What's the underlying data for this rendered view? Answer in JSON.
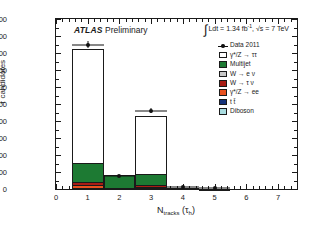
{
  "chart_data": {
    "type": "bar",
    "title": "",
    "experiment_label": "ATLAS",
    "status_label": "Preliminary",
    "lumi_text": "Ldt = 1.34 fb",
    "lumi_sup": "-1",
    "energy_text": ", √s = 7 TeV",
    "integral_symbol": "∫",
    "xlabel_main": "N",
    "xlabel_sub": "tracks",
    "xlabel_paren_open": " (τ",
    "xlabel_paren_sub": "h",
    "xlabel_paren_close": ")",
    "ylabel": "τ candidates",
    "xlim": [
      0,
      7.6
    ],
    "ylim": [
      0,
      2000
    ],
    "xticks": [
      0,
      1,
      2,
      3,
      4,
      5,
      6,
      7
    ],
    "yticks": [
      0,
      200,
      400,
      600,
      800,
      1000,
      1200,
      1400,
      1600,
      1800,
      2000
    ],
    "grid": false,
    "legend_position": "upper-right",
    "categories": [
      1,
      2,
      3,
      4,
      5,
      6,
      7
    ],
    "bin_width": 1,
    "series": [
      {
        "name": "γ*/Z → ττ",
        "color": "#ffffff",
        "values": [
          1345,
          0,
          685,
          0,
          0,
          0,
          0
        ]
      },
      {
        "name": "Multijet",
        "color": "#1d7a33",
        "values": [
          220,
          150,
          130,
          8,
          2,
          0,
          0
        ]
      },
      {
        "name": "W → e ν",
        "color": "#c8c8c8",
        "values": [
          8,
          3,
          4,
          0,
          0,
          0,
          0
        ]
      },
      {
        "name": "W → τ ν",
        "color": "#a81c14",
        "values": [
          28,
          4,
          20,
          1,
          0,
          0,
          0
        ]
      },
      {
        "name": "γ*/Z → ee",
        "color": "#e8511f",
        "values": [
          40,
          3,
          18,
          0,
          0,
          0,
          0
        ]
      },
      {
        "name": "t t̄",
        "color": "#16337a",
        "values": [
          6,
          1,
          3,
          0,
          0,
          0,
          0
        ]
      },
      {
        "name": "Diboson",
        "color": "#a9dce0",
        "values": [
          3,
          1,
          2,
          0,
          0,
          0,
          0
        ]
      }
    ],
    "stack_totals": [
      1650,
      162,
      862,
      9,
      2,
      0,
      0
    ],
    "data_label": "Data 2011",
    "data_points": {
      "x": [
        1,
        2,
        3,
        4,
        5,
        6,
        7
      ],
      "y": [
        1700,
        152,
        920,
        18,
        6,
        0,
        0
      ],
      "yerr": [
        42,
        13,
        31,
        5,
        3,
        0,
        0
      ]
    }
  },
  "legend": {
    "entries": [
      {
        "label": "Data 2011",
        "type": "marker",
        "color": "#111111"
      },
      {
        "label": "γ*/Z →  ττ",
        "type": "box",
        "color": "#ffffff"
      },
      {
        "label": "Multijet",
        "type": "box",
        "color": "#1d7a33"
      },
      {
        "label": "W → e ν",
        "type": "box",
        "color": "#c8c8c8"
      },
      {
        "label": "W → τ ν",
        "type": "box",
        "color": "#a81c14"
      },
      {
        "label": "γ*/Z → ee",
        "type": "box",
        "color": "#e8511f"
      },
      {
        "label": "t t̄",
        "type": "box",
        "color": "#16337a"
      },
      {
        "label": "Diboson",
        "type": "box",
        "color": "#a9dce0"
      }
    ]
  }
}
